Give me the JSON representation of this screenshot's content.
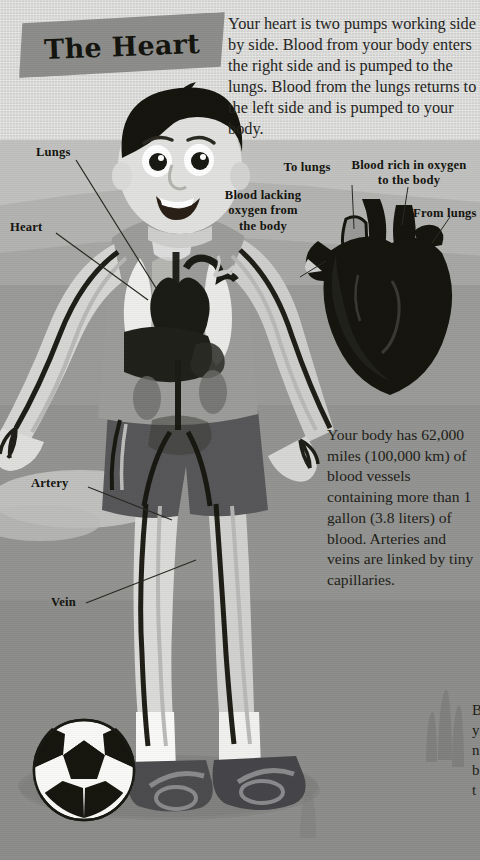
{
  "page": {
    "title": "The Heart"
  },
  "banner": {
    "title": "The Heart",
    "color": "#8e8e8c"
  },
  "intro": {
    "text": "Your heart is two pumps working side by side. Blood from your body enters the right side and is pumped to the lungs. Blood from the lungs returns to the left side and is pumped to your body."
  },
  "factbox": {
    "text": "Your body has 62,000 miles (100,000 km) of blood vessels containing more than 1 gallon (3.8 liters) of blood. Arteries and veins are linked by tiny capillaries."
  },
  "body_labels": {
    "lungs": "Lungs",
    "heart": "Heart",
    "artery": "Artery",
    "vein": "Vein"
  },
  "heart_labels": {
    "to_lungs": "To lungs",
    "blood_rich": "Blood rich in oxygen\nto the body",
    "blood_lacking": "Blood lacking\noxygen from\nthe body",
    "from_lungs": "From lungs"
  },
  "edge": {
    "clipped_text": "B\ny\nn\nb\nt"
  },
  "colors": {
    "ink": "#15150f",
    "paper_sky": "#d6d6d4",
    "ground": "#949492",
    "banner": "#8e8e8c",
    "skin": "#d9d9d7",
    "hair": "#15150f",
    "shirt": "#9a9a98",
    "shorts": "#58585a",
    "shoe": "#4a4a4c",
    "lung": "#f2f2f0",
    "organ_dark": "#1b1b16"
  },
  "figure": {
    "name": "boy-with-soccer-ball",
    "items": [
      "hair",
      "face",
      "eyes",
      "mouth",
      "shirt",
      "arms",
      "shorts",
      "legs",
      "socks",
      "shoes",
      "soccer-ball",
      "circulatory-overlay",
      "lungs",
      "heart",
      "liver",
      "kidneys"
    ]
  },
  "heart_diagram": {
    "name": "anatomical-heart-cross-section"
  }
}
